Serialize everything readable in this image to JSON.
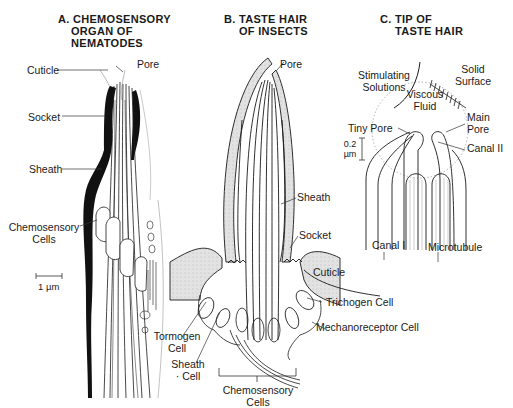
{
  "panels": {
    "a": {
      "title_line1": "A. CHEMOSENSORY",
      "title_line2": "ORGAN OF",
      "title_line3": "NEMATODES",
      "labels": {
        "cuticle": "Cuticle",
        "pore": "Pore",
        "socket": "Socket",
        "sheath": "Sheath",
        "chemo_line1": "Chemosensory",
        "chemo_line2": "Cells",
        "scale": "1 µm"
      }
    },
    "b": {
      "title_line1": "B. TASTE HAIR",
      "title_line2": "OF INSECTS",
      "labels": {
        "pore": "Pore",
        "sheath": "Sheath",
        "socket": "Socket",
        "cuticle": "Cuticle",
        "trichogen": "Trichogen Cell",
        "mechanoreceptor": "Mechanoreceptor Cell",
        "tormogen_line1": "Tormogen",
        "tormogen_line2": "Cell",
        "sheath_cell_line1": "Sheath",
        "sheath_cell_line2": "· Cell",
        "chemo_line1": "Chemosensory",
        "chemo_line2": "Cells"
      }
    },
    "c": {
      "title_line1": "C. TIP OF",
      "title_line2": "TASTE HAIR",
      "labels": {
        "stim_line1": "Stimulating",
        "stim_line2": "Solutions",
        "solid_line1": "Solid",
        "solid_line2": "Surface",
        "viscous_line1": "Viscous",
        "viscous_line2": "Fluid",
        "tiny_pore": "Tiny Pore",
        "main_pore_line1": "Main",
        "main_pore_line2": "Pore",
        "canal2": "Canal II",
        "canal1": "Canal I",
        "microtubule": "Microtubule",
        "scale_line1": "0.2",
        "scale_line2": "µm"
      }
    }
  },
  "colors": {
    "ink": "#1a1a1a",
    "shade": "#d8d8d8",
    "leader": "#333333"
  }
}
